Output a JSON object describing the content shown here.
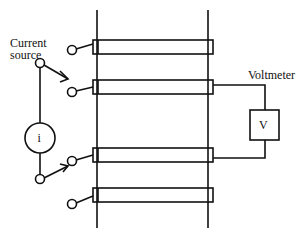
{
  "diagram": {
    "labels": {
      "current_line1": "Current",
      "current_line2": "source",
      "voltmeter": "Voltmeter",
      "current_symbol": "i",
      "voltmeter_symbol": "V"
    },
    "colors": {
      "stroke": "#111111",
      "background": "#ffffff"
    },
    "components": {
      "rails": [
        "left-rail",
        "right-rail"
      ],
      "contacts": [
        "contact-1",
        "contact-2",
        "contact-3",
        "contact-4"
      ],
      "current_source": "i",
      "voltmeter": "V",
      "switches": [
        "switch-top",
        "switch-bottom"
      ]
    }
  }
}
